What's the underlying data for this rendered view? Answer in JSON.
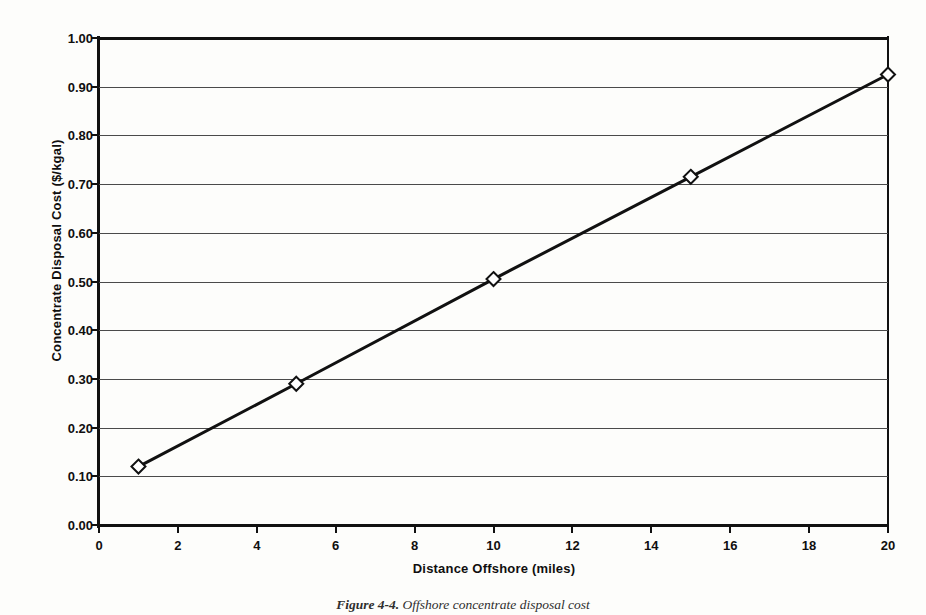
{
  "chart_data": {
    "type": "line",
    "title": "",
    "xlabel": "Distance Offshore (miles)",
    "ylabel": "Concentrate Disposal Cost ($/kgal)",
    "x": [
      1,
      5,
      10,
      15,
      20
    ],
    "values": [
      0.12,
      0.29,
      0.505,
      0.715,
      0.925
    ],
    "series": [
      {
        "name": "Concentrate Disposal Cost",
        "x": [
          1,
          5,
          10,
          15,
          20
        ],
        "values": [
          0.12,
          0.29,
          0.505,
          0.715,
          0.925
        ]
      }
    ],
    "xlim": [
      0,
      20
    ],
    "ylim": [
      0,
      1.0
    ],
    "xticks": [
      0,
      2,
      4,
      6,
      8,
      10,
      12,
      14,
      16,
      18,
      20
    ],
    "xtick_labels": [
      "0",
      "2",
      "4",
      "6",
      "8",
      "10",
      "12",
      "14",
      "16",
      "18",
      "20"
    ],
    "yticks": [
      0.0,
      0.1,
      0.2,
      0.3,
      0.4,
      0.5,
      0.6,
      0.7,
      0.8,
      0.9,
      1.0
    ],
    "ytick_labels": [
      "0.00",
      "0.10",
      "0.20",
      "0.30",
      "0.40",
      "0.50",
      "0.60",
      "0.70",
      "0.80",
      "0.90",
      "1.00"
    ],
    "grid": "horizontal",
    "legend": "none",
    "marker": "open-diamond",
    "line_color": "#111111",
    "marker_fill": "#ffffff",
    "marker_edge": "#111111",
    "grid_color": "#4a4a4a",
    "background": "#fdfdfb"
  },
  "caption": {
    "number": "Figure 4-4.",
    "text": "Offshore concentrate disposal cost"
  }
}
